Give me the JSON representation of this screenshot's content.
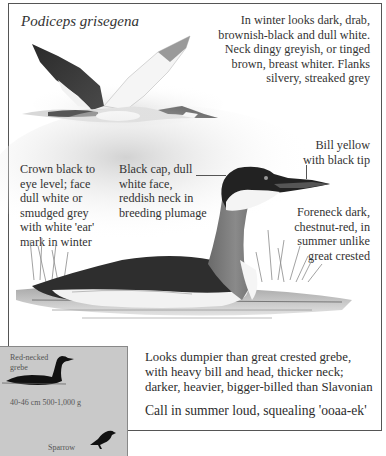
{
  "species": {
    "scientific_name": "Podiceps grisegena"
  },
  "annotations": {
    "winter_plumage": "In winter looks dark, drab, brownish-black and dull white. Neck dingy greyish, or tinged brown, breast whiter. Flanks silvery, streaked grey",
    "winter_plumage_lines": [
      "In winter looks dark, drab,",
      "brownish-black and dull white.",
      "Neck dingy greyish, or tinged",
      "brown, breast whiter. Flanks",
      "silvery, streaked grey"
    ],
    "bill_lines": [
      "Bill yellow",
      "with black tip"
    ],
    "crown_lines": [
      "Crown black to",
      "eye level; face",
      "dull white or",
      "smudged grey",
      "with white 'ear'",
      "mark in winter"
    ],
    "cap_lines": [
      "Black cap, dull",
      "white face,",
      "reddish neck in",
      "breeding plumage"
    ],
    "foreneck_lines": [
      "Foreneck dark,",
      "chestnut-red, in",
      "summer unlike",
      "great crested"
    ]
  },
  "description": {
    "comparison_lines": [
      "Looks dumpier than great crested grebe,",
      "with heavy bill and head, thicker neck;",
      "darker, heavier, bigger-billed than Slavonian"
    ],
    "call": "Call in summer loud, squealing 'ooaa-ek'"
  },
  "size_comparison": {
    "bird_label_lines": [
      "Red-necked",
      "grebe"
    ],
    "measurements": "40-46 cm  500-1,000 g",
    "reference_label": "Sparrow",
    "box_color": "#c9c9c9"
  },
  "illustrations": {
    "flying_bird": "red-necked-grebe-in-flight",
    "swimming_bird": "red-necked-grebe-swimming",
    "grebe_silhouette": "grebe-silhouette-icon",
    "sparrow_silhouette": "sparrow-silhouette-icon"
  }
}
